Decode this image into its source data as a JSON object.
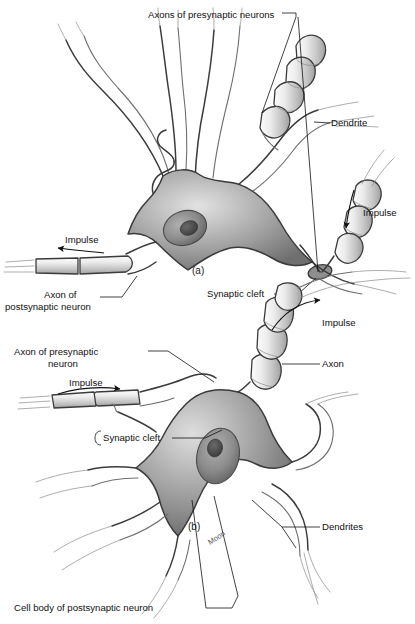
{
  "figure": {
    "background_color": "#ffffff",
    "ink_color": "#111111",
    "outline_color": "#3b3b3b",
    "soma_fill_light": "#cfcfcf",
    "soma_fill_mid": "#9a9a9a",
    "soma_fill_dark": "#6b6b6b",
    "nucleus_fill": "#8a8a8a",
    "nucleolus_fill": "#4a4a4a",
    "axon_fill_light": "#f2f2f2",
    "axon_fill_mid": "#cccccc"
  },
  "panels": [
    {
      "id": "a",
      "caption": "(a)",
      "caption_x": 192,
      "caption_y": 274
    },
    {
      "id": "b",
      "caption": "(b)",
      "caption_x": 188,
      "caption_y": 530
    }
  ],
  "labels": [
    {
      "name": "axons-of-presynaptic-neurons",
      "text": "Axons of presynaptic neurons",
      "x": 148,
      "y": 15,
      "anchor": "start",
      "panel": "a"
    },
    {
      "name": "dendrite",
      "text": "Dendrite",
      "x": 331,
      "y": 123,
      "anchor": "start",
      "panel": "a"
    },
    {
      "name": "impulse-right-upper",
      "text": "Impulse",
      "x": 363,
      "y": 213,
      "anchor": "start",
      "panel": "a"
    },
    {
      "name": "impulse-left-upper",
      "text": "Impulse",
      "x": 65,
      "y": 240,
      "anchor": "start",
      "panel": "a"
    },
    {
      "name": "axon-of-postsynaptic-neuron-line1",
      "text": "Axon of",
      "x": 44,
      "y": 295,
      "anchor": "start",
      "panel": "a"
    },
    {
      "name": "axon-of-postsynaptic-neuron-line2",
      "text": "postsynaptic neuron",
      "x": 5,
      "y": 307,
      "anchor": "start",
      "panel": "a"
    },
    {
      "name": "synaptic-cleft-upper",
      "text": "Synaptic cleft",
      "x": 207,
      "y": 294,
      "anchor": "start",
      "panel": "a"
    },
    {
      "name": "impulse-right-lower",
      "text": "Impulse",
      "x": 322,
      "y": 323,
      "anchor": "start",
      "panel": "b"
    },
    {
      "name": "axon-of-presynaptic-neuron-line1",
      "text": "Axon of presynaptic",
      "x": 14,
      "y": 352,
      "anchor": "start",
      "panel": "b"
    },
    {
      "name": "axon-of-presynaptic-neuron-line2",
      "text": "neuron",
      "x": 48,
      "y": 364,
      "anchor": "start",
      "panel": "b"
    },
    {
      "name": "axon",
      "text": "Axon",
      "x": 322,
      "y": 364,
      "anchor": "start",
      "panel": "b"
    },
    {
      "name": "impulse-left-lower",
      "text": "Impulse",
      "x": 69,
      "y": 383,
      "anchor": "start",
      "panel": "b"
    },
    {
      "name": "synaptic-cleft-lower",
      "text": "Synaptic cleft",
      "x": 103,
      "y": 438,
      "anchor": "start",
      "panel": "b"
    },
    {
      "name": "dendrites",
      "text": "Dendrites",
      "x": 322,
      "y": 527,
      "anchor": "start",
      "panel": "b"
    },
    {
      "name": "cell-body-of-postsynaptic-neuron",
      "text": "Cell body of postsynaptic neuron",
      "x": 14,
      "y": 608,
      "anchor": "start",
      "panel": "b"
    }
  ],
  "artist_signature": {
    "text": "Moon",
    "x": 210,
    "y": 545,
    "rotation": -33
  }
}
